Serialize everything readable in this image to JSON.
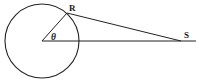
{
  "figure": {
    "name": "circle-tangent-angle-diagram",
    "type": "geometry-diagram",
    "width": 199,
    "height": 81,
    "background_color": "#ffffff",
    "stroke_color": "#222222"
  },
  "labels": {
    "point_r": "R",
    "point_s": "S",
    "angle_theta": "θ"
  },
  "geometry": {
    "circle": {
      "center_x": 42,
      "center_y": 41,
      "radius": 37
    },
    "points": {
      "center": {
        "x": 42,
        "y": 41
      },
      "r": {
        "x": 67,
        "y": 13
      },
      "s": {
        "x": 181,
        "y": 41
      },
      "horizontal_end": {
        "x": 196,
        "y": 41
      }
    },
    "segments": [
      {
        "name": "radius-center-to-r",
        "x1": 42,
        "y1": 41,
        "x2": 67,
        "y2": 13
      },
      {
        "name": "tangent-r-to-s",
        "x1": 67,
        "y1": 13,
        "x2": 181,
        "y2": 41
      },
      {
        "name": "horizontal-center-to-s",
        "x1": 42,
        "y1": 41,
        "x2": 196,
        "y2": 41
      }
    ],
    "label_positions": {
      "r": {
        "x": 69,
        "y": 11
      },
      "s": {
        "x": 184,
        "y": 38
      },
      "theta": {
        "x": 51,
        "y": 40
      }
    }
  }
}
